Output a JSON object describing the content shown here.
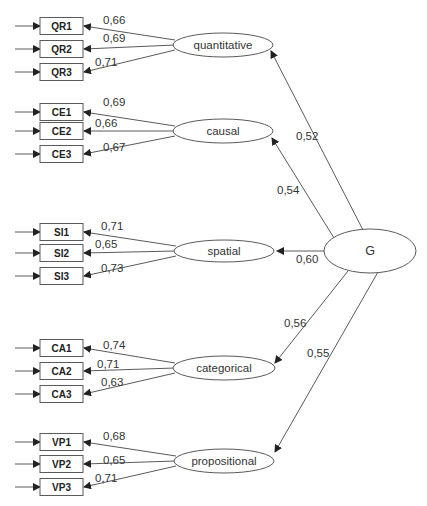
{
  "diagram": {
    "type": "structural-equation-model",
    "general_factor": {
      "label": "G",
      "cx": 370,
      "cy": 251,
      "rx": 46,
      "ry": 22
    },
    "factors": [
      {
        "label": "quantitative",
        "cx": 223,
        "cy": 45,
        "rx": 50,
        "ry": 12,
        "loading": "0,52",
        "loading_pos": [
          296,
          140
        ],
        "g_start": [
          363,
          230
        ],
        "arrow_end": [
          271,
          51
        ],
        "indicators": [
          {
            "label": "QR1",
            "y": 26,
            "coef": "0,66",
            "coef_pos": [
              103,
              24
            ]
          },
          {
            "label": "QR2",
            "y": 49,
            "coef": "0,69",
            "coef_pos": [
              103,
              42
            ]
          },
          {
            "label": "QR3",
            "y": 72,
            "coef": "0,71",
            "coef_pos": [
              95,
              66
            ]
          }
        ]
      },
      {
        "label": "causal",
        "cx": 223,
        "cy": 131,
        "rx": 50,
        "ry": 12,
        "loading": "0,54",
        "loading_pos": [
          277,
          194
        ],
        "g_start": [
          334,
          238
        ],
        "arrow_end": [
          272,
          138
        ],
        "indicators": [
          {
            "label": "CE1",
            "y": 112,
            "coef": "0,69",
            "coef_pos": [
              103,
              106
            ]
          },
          {
            "label": "CE2",
            "y": 131,
            "coef": "0,66",
            "coef_pos": [
              95,
              127
            ]
          },
          {
            "label": "CE3",
            "y": 154,
            "coef": "0,67",
            "coef_pos": [
              103,
              151
            ]
          }
        ]
      },
      {
        "label": "spatial",
        "cx": 224,
        "cy": 251,
        "rx": 50,
        "ry": 11,
        "loading": "0,60",
        "loading_pos": [
          296,
          263
        ],
        "g_start": [
          324,
          251
        ],
        "arrow_end": [
          277,
          251
        ],
        "indicators": [
          {
            "label": "SI1",
            "y": 232,
            "coef": "0,71",
            "coef_pos": [
              101,
              230
            ]
          },
          {
            "label": "SI2",
            "y": 253,
            "coef": "0,65",
            "coef_pos": [
              95,
              248
            ]
          },
          {
            "label": "SI3",
            "y": 276,
            "coef": "0,73",
            "coef_pos": [
              101,
              272
            ]
          }
        ]
      },
      {
        "label": "categorical",
        "cx": 224,
        "cy": 368,
        "rx": 51,
        "ry": 12,
        "loading": "0,56",
        "loading_pos": [
          284,
          327
        ],
        "g_start": [
          348,
          271
        ],
        "arrow_end": [
          275,
          363
        ],
        "indicators": [
          {
            "label": "CA1",
            "y": 348,
            "coef": "0,74",
            "coef_pos": [
              103,
              349
            ]
          },
          {
            "label": "CA2",
            "y": 371,
            "coef": "0,71",
            "coef_pos": [
              97,
              368
            ]
          },
          {
            "label": "CA3",
            "y": 394,
            "coef": "0,63",
            "coef_pos": [
              101,
              386
            ]
          }
        ]
      },
      {
        "label": "propositional",
        "cx": 224,
        "cy": 461,
        "rx": 50,
        "ry": 12,
        "loading": "0,55",
        "loading_pos": [
          307,
          357
        ],
        "g_start": [
          378,
          272
        ],
        "arrow_end": [
          275,
          452
        ],
        "indicators": [
          {
            "label": "VP1",
            "y": 442,
            "coef": "0,68",
            "coef_pos": [
              103,
              440
            ]
          },
          {
            "label": "VP2",
            "y": 464,
            "coef": "0,65",
            "coef_pos": [
              103,
              464
            ]
          },
          {
            "label": "VP3",
            "y": 487,
            "coef": "0,71",
            "coef_pos": [
              95,
              482
            ]
          }
        ]
      }
    ],
    "indicator_box": {
      "x": 40,
      "width": 43,
      "height": 17
    },
    "error_arrow_start_x": 15,
    "colors": {
      "stroke": "#5a5a5a",
      "text": "#333333",
      "background": "#ffffff"
    }
  }
}
